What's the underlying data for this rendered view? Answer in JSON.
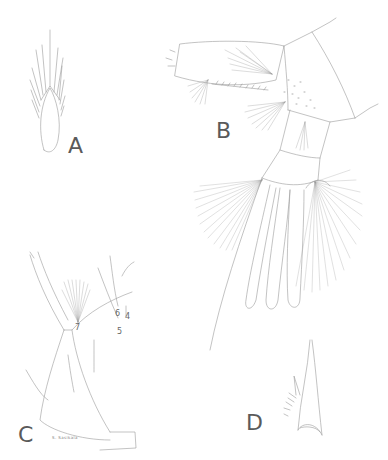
{
  "figure": {
    "panels": [
      {
        "id": "A",
        "label": "A"
      },
      {
        "id": "B",
        "label": "B"
      },
      {
        "id": "C",
        "label": "C"
      },
      {
        "id": "D",
        "label": "D"
      }
    ],
    "seta_labels": [
      "7",
      "6",
      "5",
      "4"
    ],
    "signature": "S. Sasikala",
    "colors": {
      "ink": "#8a8a8a",
      "background": "#ffffff",
      "label": "#5a5a5a"
    }
  }
}
